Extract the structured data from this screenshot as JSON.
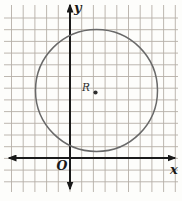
{
  "figure": {
    "background": "#fdfdfb",
    "width": 182,
    "height": 201
  },
  "grid": {
    "color": "#b5afa7",
    "spacing": 11.7,
    "vertical": {
      "x_start": 11.5,
      "count": 15,
      "y1": 5,
      "y2": 192
    },
    "horizontal": {
      "y_start": 18,
      "count": 15,
      "x1": 4,
      "x2": 178
    }
  },
  "axes": {
    "color": "#1a1a1a",
    "stroke_width": 2,
    "x": {
      "y": 158,
      "center_x": 70,
      "tip_left": 9,
      "tip_right": 175,
      "label": "x",
      "label_x": 170,
      "label_y": 173.5
    },
    "y": {
      "x": 70,
      "center_y": 158,
      "tip_top": 5,
      "tip_bottom": 189,
      "label": "y",
      "label_x": 74,
      "label_y": 12
    },
    "origin": {
      "label": "O",
      "x": 56.5,
      "y": 169.5
    }
  },
  "circle": {
    "cx": 96.5,
    "cy": 90.5,
    "r": 61,
    "stroke": "#696969",
    "stroke_width": 1.5
  },
  "point": {
    "label": "R",
    "label_x": 82,
    "label_y": 90.5,
    "dot_x": 95.5,
    "dot_y": 92.5,
    "dot_r": 2.1,
    "color": "#2d2d2d"
  }
}
